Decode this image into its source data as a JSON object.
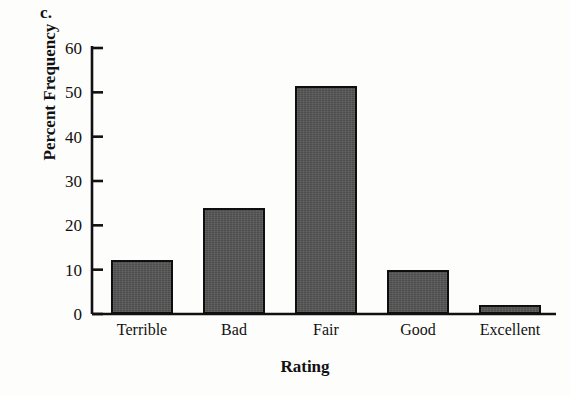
{
  "panel": {
    "label": "c."
  },
  "chart_data": {
    "type": "bar",
    "title": "",
    "xlabel": "Rating",
    "ylabel": "Percent Frequency",
    "categories": [
      "Terrible",
      "Bad",
      "Fair",
      "Good",
      "Excellent"
    ],
    "values": [
      12.2,
      24,
      51.5,
      10,
      2
    ],
    "ylim": [
      0,
      60
    ],
    "yticks": [
      0,
      10,
      20,
      30,
      40,
      50,
      60
    ],
    "ytick_labels": [
      "0",
      "10",
      "20",
      "30",
      "40",
      "50",
      "60"
    ],
    "grid": false,
    "legend": false,
    "bar_fill_color": "#565656",
    "bar_edge_color": "#0f0f0f",
    "axis_color": "#111111",
    "background_color": "#fdfdfc"
  }
}
